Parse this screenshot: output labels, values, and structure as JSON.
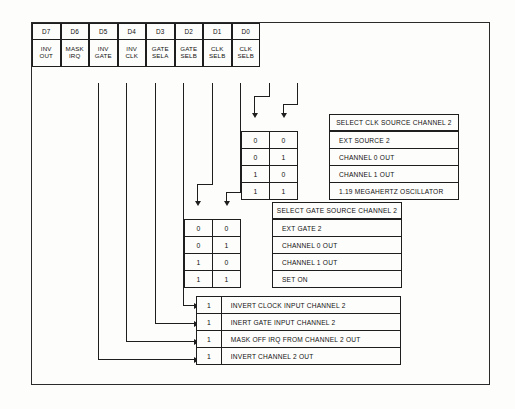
{
  "diagram": {
    "ink_color": "#1e1e1e",
    "background_color": "#fdfdfb"
  },
  "register": {
    "name": "control-register",
    "bits": [
      {
        "bit": "D7",
        "line1": "INV",
        "line2": "OUT"
      },
      {
        "bit": "D6",
        "line1": "MASK",
        "line2": "IRQ"
      },
      {
        "bit": "D5",
        "line1": "INV",
        "line2": "GATE"
      },
      {
        "bit": "D4",
        "line1": "INV",
        "line2": "CLK"
      },
      {
        "bit": "D3",
        "line1": "GATE",
        "line2": "SELA"
      },
      {
        "bit": "D2",
        "line1": "GATE",
        "line2": "SELB"
      },
      {
        "bit": "D1",
        "line1": "CLK",
        "line2": "SELB"
      },
      {
        "bit": "D0",
        "line1": "CLK",
        "line2": "SELB"
      }
    ]
  },
  "clk_table": {
    "title": "SELECT CLK SOURCE CHANNEL 2",
    "rows": [
      {
        "b1": "0",
        "b0": "0",
        "desc": "EXT SOURCE 2"
      },
      {
        "b1": "0",
        "b0": "1",
        "desc": "CHANNEL 0 OUT"
      },
      {
        "b1": "1",
        "b0": "0",
        "desc": "CHANNEL 1 OUT"
      },
      {
        "b1": "1",
        "b0": "1",
        "desc": "1.19 MEGAHERTZ OSCILLATOR"
      }
    ]
  },
  "gate_table": {
    "title": "SELECT GATE SOURCE CHANNEL 2",
    "rows": [
      {
        "b1": "0",
        "b0": "0",
        "desc": "EXT GATE 2"
      },
      {
        "b1": "0",
        "b0": "1",
        "desc": "CHANNEL 0 OUT"
      },
      {
        "b1": "1",
        "b0": "0",
        "desc": "CHANNEL 1 OUT"
      },
      {
        "b1": "1",
        "b0": "1",
        "desc": "SET ON"
      }
    ]
  },
  "flag_table": {
    "rows": [
      {
        "bit": "1",
        "desc": "INVERT CLOCK INPUT CHANNEL 2"
      },
      {
        "bit": "1",
        "desc": "INERT GATE INPUT CHANNEL 2"
      },
      {
        "bit": "1",
        "desc": "MASK OFF IRQ FROM CHANNEL 2 OUT"
      },
      {
        "bit": "1",
        "desc": "INVERT CHANNEL 2 OUT"
      }
    ]
  }
}
